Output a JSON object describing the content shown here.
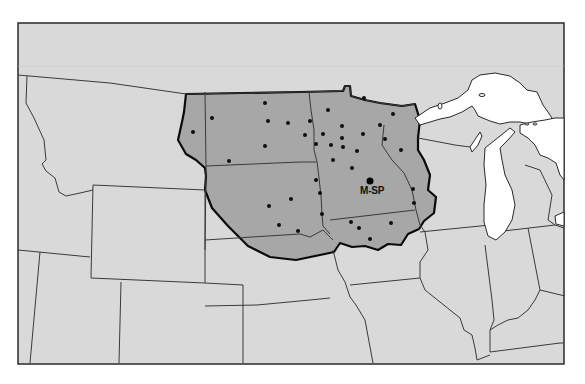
{
  "map": {
    "type": "regional service area map",
    "colors": {
      "background": "#ffffff",
      "land": "#d9d9d9",
      "shaded_region": "#a7a7a7",
      "boundary": "#0a0a0a",
      "water": "#ffffff",
      "points": "#0d0d0d"
    },
    "hub": {
      "label": "M-SP",
      "x": 370,
      "y": 181
    },
    "sites": [
      {
        "x": 193,
        "y": 132
      },
      {
        "x": 212,
        "y": 118
      },
      {
        "x": 229,
        "y": 161
      },
      {
        "x": 265,
        "y": 103
      },
      {
        "x": 268,
        "y": 121
      },
      {
        "x": 265,
        "y": 146
      },
      {
        "x": 288,
        "y": 123
      },
      {
        "x": 310,
        "y": 121
      },
      {
        "x": 305,
        "y": 135
      },
      {
        "x": 306,
        "y": 134
      },
      {
        "x": 316,
        "y": 144
      },
      {
        "x": 328,
        "y": 110
      },
      {
        "x": 323,
        "y": 134
      },
      {
        "x": 342,
        "y": 126
      },
      {
        "x": 342,
        "y": 138
      },
      {
        "x": 331,
        "y": 145
      },
      {
        "x": 343,
        "y": 147
      },
      {
        "x": 357,
        "y": 151
      },
      {
        "x": 363,
        "y": 134
      },
      {
        "x": 364,
        "y": 98
      },
      {
        "x": 380,
        "y": 125
      },
      {
        "x": 393,
        "y": 114
      },
      {
        "x": 385,
        "y": 139
      },
      {
        "x": 401,
        "y": 150
      },
      {
        "x": 333,
        "y": 160
      },
      {
        "x": 352,
        "y": 168
      },
      {
        "x": 316,
        "y": 180
      },
      {
        "x": 413,
        "y": 189
      },
      {
        "x": 414,
        "y": 203
      },
      {
        "x": 320,
        "y": 193
      },
      {
        "x": 291,
        "y": 199
      },
      {
        "x": 269,
        "y": 206
      },
      {
        "x": 322,
        "y": 214
      },
      {
        "x": 279,
        "y": 225
      },
      {
        "x": 298,
        "y": 231
      },
      {
        "x": 351,
        "y": 222
      },
      {
        "x": 359,
        "y": 228
      },
      {
        "x": 391,
        "y": 223
      },
      {
        "x": 370,
        "y": 239
      }
    ],
    "water_bodies": [
      "lake-superior",
      "lake-michigan",
      "lake-huron"
    ]
  }
}
